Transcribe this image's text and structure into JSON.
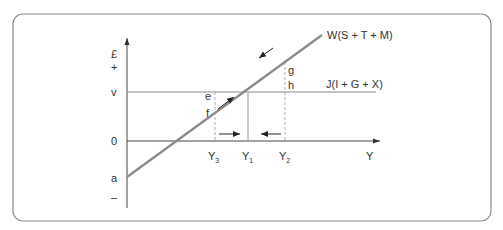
{
  "diagram": {
    "type": "circular-flow-equilibrium",
    "colors": {
      "frame": "#8a8a8a",
      "axis": "#444444",
      "w_line": "#8a8a8a",
      "j_line": "#8a8a8a",
      "dashed": "#9a9a9a",
      "arrow": "#333333",
      "text": "#333333"
    },
    "axes": {
      "y_top_label": "£",
      "y_plus": "+",
      "y_minus": "–",
      "x_label": "Y",
      "origin_label": "0"
    },
    "lines": {
      "withdrawals": "W(S + T + M)",
      "injections": "J(I + G + X)"
    },
    "levels": {
      "v": "v",
      "a": "a"
    },
    "points": {
      "e": "e",
      "f": "f",
      "g": "g",
      "h": "h"
    },
    "incomes": {
      "y3": {
        "base": "Y",
        "sub": "3"
      },
      "y1": {
        "base": "Y",
        "sub": "1"
      },
      "y2": {
        "base": "Y",
        "sub": "2"
      }
    }
  }
}
